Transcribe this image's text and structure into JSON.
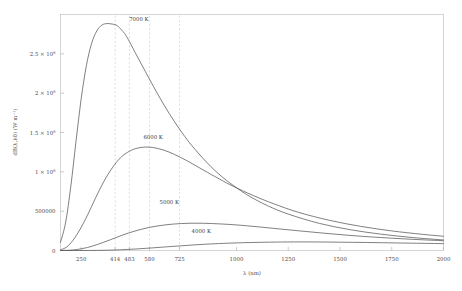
{
  "chart_data": {
    "type": "line",
    "title": "",
    "xlabel": "λ (nm)",
    "ylabel": "dB(λ,λ0) (W m⁻¹)",
    "xlim": [
      150,
      2000
    ],
    "ylim": [
      0,
      3000000
    ],
    "grid": false,
    "legend_position": "inline-curve-labels",
    "x_ticks": [
      {
        "value": 250,
        "label": "250"
      },
      {
        "value": 414,
        "label": "414"
      },
      {
        "value": 483,
        "label": "483"
      },
      {
        "value": 580,
        "label": "580"
      },
      {
        "value": 725,
        "label": "725"
      },
      {
        "value": 1000,
        "label": "1000"
      },
      {
        "value": 1250,
        "label": "1250"
      },
      {
        "value": 1500,
        "label": "1500"
      },
      {
        "value": 1750,
        "label": "1750"
      },
      {
        "value": 2000,
        "label": "2000"
      }
    ],
    "y_ticks": [
      {
        "value": 0,
        "mantissa": "0",
        "exponent": ""
      },
      {
        "value": 500000,
        "mantissa": "500000",
        "exponent": ""
      },
      {
        "value": 1000000,
        "mantissa": "1 × 10",
        "exponent": "6"
      },
      {
        "value": 1500000,
        "mantissa": "1.5 × 10",
        "exponent": "6"
      },
      {
        "value": 2000000,
        "mantissa": "2 × 10",
        "exponent": "6"
      },
      {
        "value": 2500000,
        "mantissa": "2.5 × 10",
        "exponent": "6"
      }
    ],
    "series": [
      {
        "name": "7000 K",
        "temperature": 7000,
        "peak_wavelength_nm": 414,
        "peak_value": 2880000,
        "label": "7000 K",
        "color": "#565656",
        "points_nm": [
          150,
          175,
          200,
          225,
          250,
          275,
          300,
          325,
          350,
          375,
          400,
          414,
          430,
          460,
          483,
          520,
          560,
          600,
          650,
          700,
          750,
          800,
          875,
          950,
          1050,
          1150,
          1250,
          1400,
          1550,
          1700,
          1850,
          2000
        ],
        "values": [
          104000,
          360000,
          820000,
          1390000,
          1930000,
          2350000,
          2630000,
          2790000,
          2865000,
          2885000,
          2878000,
          2871000,
          2845000,
          2757000,
          2655000,
          2470000,
          2275000,
          2080000,
          1850000,
          1640000,
          1450000,
          1285000,
          1070000,
          895000,
          710000,
          570000,
          463000,
          345000,
          264000,
          207000,
          165000,
          134000
        ]
      },
      {
        "name": "6000 K",
        "temperature": 6000,
        "peak_wavelength_nm": 483,
        "peak_value": 1385000,
        "label": "6000 K",
        "color": "#565656",
        "points_nm": [
          150,
          180,
          210,
          245,
          280,
          320,
          360,
          400,
          440,
          483,
          520,
          560,
          600,
          650,
          700,
          760,
          820,
          900,
          980,
          1080,
          1180,
          1300,
          1450,
          1600,
          1750,
          1900,
          2000
        ],
        "values": [
          8800,
          44000,
          128000,
          272000,
          447000,
          672000,
          880000,
          1050000,
          1180000,
          1262000,
          1300000,
          1315000,
          1308000,
          1275000,
          1222000,
          1142000,
          1053000,
          934000,
          822000,
          700000,
          594000,
          485000,
          383000,
          307000,
          249000,
          205000,
          181000
        ]
      },
      {
        "name": "5000 K",
        "temperature": 5000,
        "peak_wavelength_nm": 580,
        "peak_value": 534000,
        "label": "5000 K",
        "color": "#565656",
        "points_nm": [
          150,
          190,
          230,
          280,
          330,
          390,
          450,
          510,
          580,
          640,
          700,
          770,
          840,
          920,
          1000,
          1100,
          1200,
          1330,
          1470,
          1620,
          1780,
          1900,
          2000
        ],
        "values": [
          390,
          3300,
          12800,
          38000,
          78000,
          136000,
          196000,
          248000,
          294000,
          320000,
          337000,
          346000,
          346000,
          338000,
          325000,
          302000,
          276000,
          243000,
          209000,
          178000,
          152000,
          136000,
          124000
        ]
      },
      {
        "name": "4000 K",
        "temperature": 4000,
        "peak_wavelength_nm": 725,
        "peak_value": 175000,
        "label": "4000 K",
        "color": "#565656",
        "points_nm": [
          150,
          220,
          290,
          360,
          440,
          520,
          600,
          680,
          725,
          800,
          880,
          960,
          1060,
          1160,
          1280,
          1420,
          1560,
          1700,
          1850,
          2000
        ],
        "values": [
          1,
          60,
          640,
          2900,
          9200,
          20000,
          34500,
          50000,
          58000,
          72000,
          84000,
          93000,
          101000,
          106000,
          109000,
          108000,
          104000,
          99000,
          93000,
          87000
        ]
      }
    ],
    "peak_guide_lines": [
      {
        "label": "7000 K peak",
        "wavelength_nm": 414
      },
      {
        "label": "6000 K peak",
        "wavelength_nm": 483
      },
      {
        "label": "5000 K peak",
        "wavelength_nm": 580
      },
      {
        "label": "4000 K peak",
        "wavelength_nm": 725
      }
    ],
    "colors": {
      "curve": "#565656",
      "frame": "#b9b9b9",
      "guide": "#c4c4c4",
      "text": "#4a4a4a",
      "background": "#ffffff"
    }
  }
}
